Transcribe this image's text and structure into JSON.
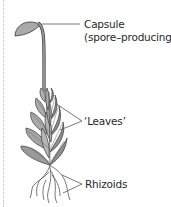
{
  "diagram": {
    "labels": {
      "capsule": "Capsule",
      "capsule_note": "(spore–producing)",
      "leaves": "‘Leaves’",
      "rhizoids": "Rhizoids"
    },
    "colors": {
      "leaf_fill": "#a9a9a9",
      "leaf_dark": "#7c7c7c",
      "outline": "#3a3a3a",
      "stalk": "#9a9a9a",
      "leader_line": "#555555",
      "margin_dots": "#b8b8b8"
    }
  }
}
